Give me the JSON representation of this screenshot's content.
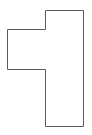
{
  "diagram": {
    "type": "polygon-outline",
    "shape": {
      "name": "rotated-T-shape",
      "points": [
        [
          45,
          10
        ],
        [
          83,
          10
        ],
        [
          83,
          126
        ],
        [
          45,
          126
        ],
        [
          45,
          69
        ],
        [
          7,
          69
        ],
        [
          7,
          29
        ],
        [
          45,
          29
        ]
      ],
      "stroke": "#5a5a5a",
      "stroke_width": 1,
      "fill": "#ffffff"
    },
    "background": "#ffffff"
  }
}
